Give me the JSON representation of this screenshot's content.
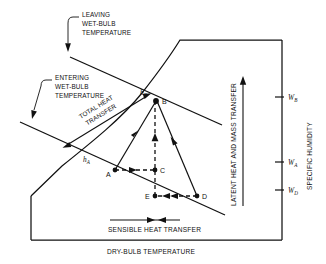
{
  "figure": {
    "type": "psychrometric-process-diagram",
    "background": "#ffffff",
    "line_color": "#111111"
  },
  "axes": {
    "x_label": "DRY-BULB TEMPERATURE",
    "y_label": "SPECIFIC HUMIDITY",
    "y_ticks": [
      {
        "id": "WB",
        "label": "W",
        "sub": "B"
      },
      {
        "id": "WA",
        "label": "W",
        "sub": "A"
      },
      {
        "id": "WD",
        "label": "W",
        "sub": "D"
      }
    ]
  },
  "annotations": {
    "leaving_wet_bulb": "LEAVING\nWET-BULB\nTEMPERATURE",
    "leaving_wet_bulb_lines": [
      "LEAVING",
      "WET-BULB",
      "TEMPERATURE"
    ],
    "entering_wet_bulb_lines": [
      "ENTERING",
      "WET-BULB",
      "TEMPERATURE"
    ],
    "total_heat_transfer_lines": [
      "TOTAL HEAT",
      "TRANSFER"
    ],
    "sensible_heat_transfer": "SENSIBLE HEAT TRANSFER",
    "latent_heat_mass_transfer": "LATENT HEAT AND MASS TRANSFER"
  },
  "enthalpy_labels": [
    {
      "id": "hB",
      "base": "h",
      "sub": "B"
    },
    {
      "id": "hA",
      "base": "h",
      "sub": "A"
    }
  ],
  "points": [
    {
      "id": "A",
      "label": "A"
    },
    {
      "id": "B",
      "label": "B"
    },
    {
      "id": "C",
      "label": "C"
    },
    {
      "id": "D",
      "label": "D"
    },
    {
      "id": "E",
      "label": "E"
    }
  ]
}
